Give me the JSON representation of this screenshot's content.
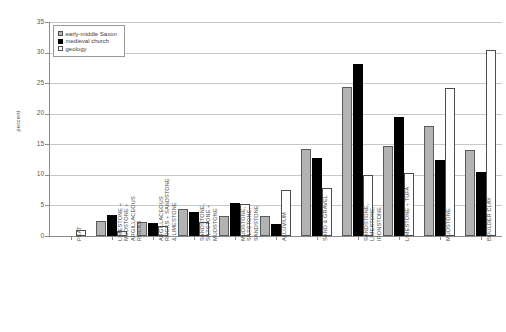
{
  "chart_data": {
    "type": "bar",
    "title": "",
    "xlabel": "",
    "ylabel": "percent",
    "ylim": [
      0,
      35
    ],
    "ytick_step": 5,
    "yticks": [
      0,
      5,
      10,
      15,
      20,
      25,
      30,
      35
    ],
    "grid": true,
    "legend_position": "top-left",
    "categories": [
      "PEAT",
      "LIMESTONE +\nMUDSTONE +\nARGILLACEOUS\nROCKS",
      "ARGILLACEOUS\nROCKS + SANDSTONE\n& LIMESTONE",
      "SANDSTONE,\nSILTSTONE +\nMUDSTONE",
      "MUDSTONE,\nSILTSTONE,\nSANDSTONE",
      "ALLUVIUM",
      "SAND & GRAVEL",
      "SANDSTONE,\nLIMESTONE,\nIRONSTONE",
      "LIMESTONE + TUFA",
      "MUDSTONE",
      "BOULDER CLAY"
    ],
    "series": [
      {
        "name": "early-middle Saxon",
        "color": "#b3b3b3",
        "values": [
          0,
          2.5,
          2.3,
          4.4,
          3.3,
          3.3,
          14.3,
          24.3,
          14.7,
          18.0,
          14.0
        ]
      },
      {
        "name": "medieval church",
        "color": "#000000",
        "values": [
          0,
          3.4,
          2.2,
          4.0,
          5.4,
          2.0,
          12.7,
          28.2,
          19.4,
          12.4,
          10.4
        ]
      },
      {
        "name": "geology",
        "color": "#ffffff",
        "values": [
          1.0,
          0.8,
          1.6,
          2.3,
          5.3,
          7.5,
          7.8,
          9.9,
          10.3,
          24.2,
          30.5
        ]
      }
    ]
  },
  "legend": {
    "items": [
      {
        "label": "early-middle Saxon"
      },
      {
        "label": "medieval church"
      },
      {
        "label": "geology"
      }
    ]
  },
  "axis": {
    "y_title": "percent",
    "y_labels": [
      "35",
      "30",
      "25",
      "20",
      "15",
      "10",
      "5",
      "0"
    ]
  }
}
